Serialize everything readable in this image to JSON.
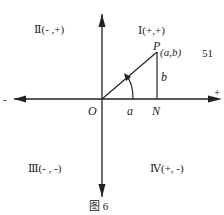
{
  "figure": {
    "caption": "图 6",
    "page_number": "51",
    "quadrants": {
      "q1": "Ⅰ(+,+)",
      "q2": "Ⅱ(- ,+)",
      "q3": "Ⅲ(- , -)",
      "q4": "Ⅳ(+, -)"
    },
    "axis_labels": {
      "origin": "O",
      "positive_x": "+",
      "negative_x": "-",
      "foot": "N"
    },
    "point": {
      "name": "P",
      "coords": "(a,b)"
    },
    "segments": {
      "horizontal": "a",
      "vertical": "b"
    },
    "colors": {
      "ink": "#222222",
      "background": "#ffffff"
    }
  }
}
